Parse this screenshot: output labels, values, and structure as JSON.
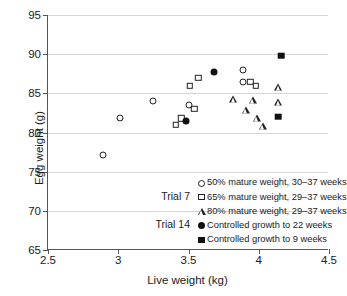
{
  "chart_data": {
    "type": "scatter",
    "title": "",
    "xlabel": "Live weight (kg)",
    "ylabel": "Egg weight (g)",
    "xlim": [
      2.5,
      4.5
    ],
    "ylim": [
      65,
      95
    ],
    "xticks": [
      "2.5",
      "3",
      "3.5",
      "4",
      "4.5"
    ],
    "xtick_values": [
      2.5,
      3,
      3.5,
      4,
      4.5
    ],
    "yticks": [
      "65",
      "70",
      "75",
      "80",
      "85",
      "90",
      "95"
    ],
    "ytick_values": [
      65,
      70,
      75,
      80,
      85,
      90,
      95
    ],
    "grid": "horizontal",
    "legend_position": "bottom-right",
    "series": [
      {
        "name": "50% mature weight, 30–37 weeks",
        "marker": "circle-open",
        "group": "Trial 7",
        "points": [
          {
            "x": 2.89,
            "y": 77.1
          },
          {
            "x": 3.01,
            "y": 81.9
          },
          {
            "x": 3.25,
            "y": 84.0
          },
          {
            "x": 3.5,
            "y": 83.5
          },
          {
            "x": 3.89,
            "y": 88.0
          },
          {
            "x": 3.89,
            "y": 86.5
          }
        ]
      },
      {
        "name": "65% mature weight, 29–37 weeks",
        "marker": "square-open",
        "group": "Trial 7",
        "points": [
          {
            "x": 3.41,
            "y": 81.0
          },
          {
            "x": 3.45,
            "y": 81.8
          },
          {
            "x": 3.51,
            "y": 86.0
          },
          {
            "x": 3.54,
            "y": 83.0
          },
          {
            "x": 3.57,
            "y": 87.0
          },
          {
            "x": 3.94,
            "y": 86.5
          },
          {
            "x": 3.98,
            "y": 86.0
          }
        ]
      },
      {
        "name": "80% mature weight, 29–37 weeks",
        "marker": "triangle-open",
        "group": "Trial 7",
        "points": [
          {
            "x": 3.82,
            "y": 84.3
          },
          {
            "x": 3.91,
            "y": 82.9
          },
          {
            "x": 3.96,
            "y": 84.2
          },
          {
            "x": 3.99,
            "y": 81.8
          },
          {
            "x": 4.03,
            "y": 80.8
          },
          {
            "x": 4.14,
            "y": 85.8
          },
          {
            "x": 4.14,
            "y": 83.9
          }
        ]
      },
      {
        "name": "Controlled growth to 22 weeks",
        "marker": "circle-filled",
        "group": "Trial 14",
        "points": [
          {
            "x": 3.48,
            "y": 81.5
          },
          {
            "x": 3.68,
            "y": 87.7
          }
        ]
      },
      {
        "name": "Controlled growth to 9 weeks",
        "marker": "square-filled",
        "group": "Trial 14",
        "points": [
          {
            "x": 4.14,
            "y": 82.0
          },
          {
            "x": 4.16,
            "y": 89.8
          }
        ]
      }
    ]
  },
  "legend": {
    "entries": [
      {
        "label": "50% mature weight, 30–37 weeks",
        "marker": "circle-open"
      },
      {
        "label": "65% mature weight, 29–37 weeks",
        "marker": "square-open"
      },
      {
        "label": "80% mature weight, 29–37 weeks",
        "marker": "triangle-open"
      },
      {
        "label": "Controlled growth to 22 weeks",
        "marker": "circle-filled"
      },
      {
        "label": "Controlled growth to 9 weeks",
        "marker": "square-filled"
      }
    ],
    "group_tags": [
      {
        "label": "Trial 7"
      },
      {
        "label": "Trial 14"
      }
    ]
  },
  "colors": {
    "marker": "#111111",
    "axis": "#555555",
    "grid": "#d6d6d6",
    "background": "#ffffff"
  }
}
